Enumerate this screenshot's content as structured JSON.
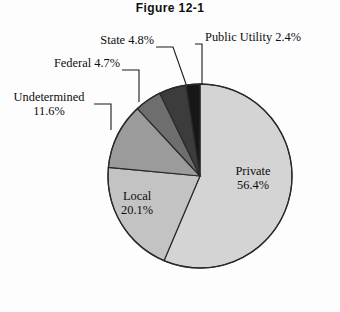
{
  "figure": {
    "title": "Figure 12-1",
    "background_color": "#fdfdfd"
  },
  "chart_data": {
    "type": "pie",
    "title": "Figure 12-1",
    "xlabel": "",
    "ylabel": "",
    "legend_position": "none",
    "grid": false,
    "start_angle_deg": 0,
    "direction": "clockwise",
    "categories": [
      "Private",
      "Local",
      "Undetermined",
      "Federal",
      "State",
      "Public Utility"
    ],
    "values": [
      56.4,
      20.1,
      11.6,
      4.7,
      4.8,
      2.4
    ],
    "unit": "%",
    "slices": [
      {
        "name": "Private",
        "value": 56.4,
        "label": "Private",
        "value_label": "56.4%",
        "color": "#d4d4d4",
        "label_placement": "inside"
      },
      {
        "name": "Local",
        "value": 20.1,
        "label": "Local",
        "value_label": "20.1%",
        "color": "#c3c3c3",
        "label_placement": "inside"
      },
      {
        "name": "Undetermined",
        "value": 11.6,
        "label": "Undetermined",
        "value_label": "11.6%",
        "color": "#9b9b9b",
        "label_placement": "outside-left"
      },
      {
        "name": "Federal",
        "value": 4.7,
        "label": "Federal 4.7%",
        "value_label": "4.7%",
        "color": "#6e6e6e",
        "label_placement": "outside-left"
      },
      {
        "name": "State",
        "value": 4.8,
        "label": "State 4.8%",
        "value_label": "4.8%",
        "color": "#3c3c3c",
        "label_placement": "outside-top"
      },
      {
        "name": "Public Utility",
        "value": 2.4,
        "label": "Public Utility 2.4%",
        "value_label": "2.4%",
        "color": "#171717",
        "label_placement": "outside-top-right"
      }
    ]
  },
  "labels": {
    "public_utility": "Public Utility 2.4%",
    "state": "State 4.8%",
    "federal": "Federal 4.7%",
    "undetermined_name": "Undetermined",
    "undetermined_value": "11.6%",
    "local_name": "Local",
    "local_value": "20.1%",
    "private_name": "Private",
    "private_value": "56.4%"
  }
}
